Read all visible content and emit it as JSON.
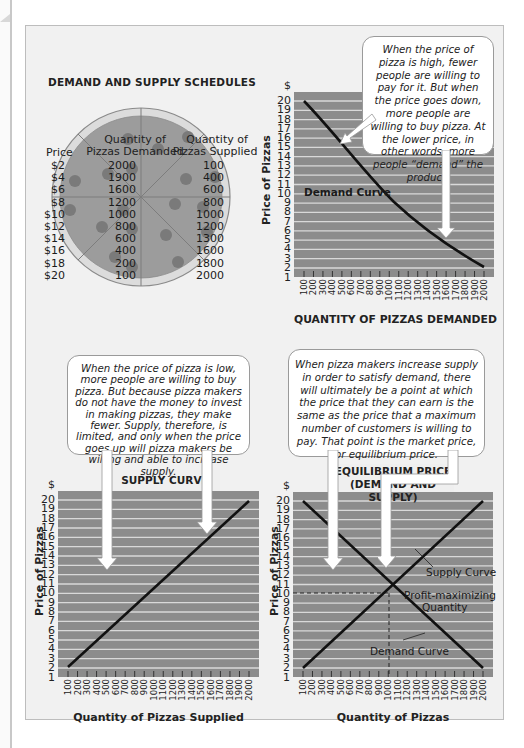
{
  "schedules": {
    "title": "DEMAND AND SUPPLY SCHEDULES",
    "headers": {
      "price": "Price",
      "demanded": [
        "Quantity of",
        "Pizzas Demanded"
      ],
      "supplied": [
        "Quantity of",
        "Pizzas Supplied"
      ]
    },
    "prices": [
      "$2",
      "$4",
      "$6",
      "$8",
      "$10",
      "$12",
      "$14",
      "$16",
      "$18",
      "$20"
    ],
    "demanded": [
      "2000",
      "1900",
      "1600",
      "1200",
      "1000",
      "800",
      "600",
      "400",
      "200",
      "100"
    ],
    "supplied": [
      "100",
      "400",
      "600",
      "800",
      "1000",
      "1200",
      "1300",
      "1600",
      "1800",
      "2000"
    ]
  },
  "demand_chart": {
    "callout": "When the price of pizza is high, fewer people are willing to pay for it. But when the price goes down, more people are willing to buy pizza. At the lower price, in other words, more people “demand” the product.",
    "curve_label": "Demand Curve",
    "ylabel": "Price of Pizzas",
    "xlabel": "QUANTITY OF PIZZAS DEMANDED"
  },
  "supply_chart": {
    "callout": "When the price of pizza is low, more people are willing to buy pizza. But because pizza makers do not have the money to invest in making pizzas, they make fewer. Supply, therefore, is limited, and only when the price goes up will pizza makers be willing and able to increase supply.",
    "header": "SUPPLY CURVE",
    "ylabel": "Price of Pizzas",
    "xlabel": "Quantity of Pizzas Supplied"
  },
  "equilibrium_chart": {
    "callout": "When pizza makers increase supply in order to satisfy demand, there will ultimately be a point at which the price that they can earn is the same as the price that a maximum number of customers is willing to pay. That point is the market price, or equilibrium price.",
    "header_line1": "EQUILIBRIUM PRICE",
    "header_line2": "(DEMAND AND SUPPLY)",
    "supply_label": "Supply Curve",
    "profit_label_1": "Profit-maximizing",
    "profit_label_2": "Quantity",
    "demand_label": "Demand Curve",
    "ylabel": "Price of Pizzas",
    "xlabel": "Quantity of Pizzas"
  },
  "axis": {
    "y_ticks": [
      "$",
      "20",
      "19",
      "18",
      "17",
      "16",
      "15",
      "14",
      "13",
      "12",
      "11",
      "10",
      "9",
      "8",
      "7",
      "6",
      "5",
      "4",
      "3",
      "2",
      "1"
    ],
    "x_ticks": [
      "100",
      "200",
      "300",
      "400",
      "500",
      "600",
      "700",
      "800",
      "900",
      "1000",
      "1100",
      "1200",
      "1300",
      "1400",
      "1500",
      "1600",
      "1700",
      "1800",
      "1900",
      "2000"
    ]
  },
  "colors": {
    "plot_bg": "#8c8c8c",
    "gridline": "#d9d9d9",
    "curve": "#111111",
    "pizza_crust": "#d6d6d6",
    "pizza_sauce": "#9a9a9a",
    "pepperoni": "#777777",
    "panel_bg": "#f1f1f1"
  },
  "chart_data": [
    {
      "type": "table",
      "title": "DEMAND AND SUPPLY SCHEDULES",
      "columns": [
        "Price",
        "Quantity of Pizzas Demanded",
        "Quantity of Pizzas Supplied"
      ],
      "rows": [
        [
          "$2",
          2000,
          100
        ],
        [
          "$4",
          1900,
          400
        ],
        [
          "$6",
          1600,
          600
        ],
        [
          "$8",
          1200,
          800
        ],
        [
          "$10",
          1000,
          1000
        ],
        [
          "$12",
          800,
          1200
        ],
        [
          "$14",
          600,
          1300
        ],
        [
          "$16",
          400,
          1600
        ],
        [
          "$18",
          200,
          1800
        ],
        [
          "$20",
          100,
          2000
        ]
      ]
    },
    {
      "type": "line",
      "title": "",
      "xlabel": "QUANTITY OF PIZZAS DEMANDED",
      "ylabel": "Price of Pizzas",
      "x": [
        100,
        500,
        1000,
        1500,
        2000
      ],
      "series": [
        {
          "name": "Demand Curve",
          "values": [
            20,
            15,
            10,
            6,
            2
          ]
        }
      ],
      "xlim": [
        100,
        2000
      ],
      "ylim": [
        1,
        20
      ],
      "grid": "horizontal"
    },
    {
      "type": "line",
      "title": "SUPPLY CURVE",
      "xlabel": "Quantity of Pizzas Supplied",
      "ylabel": "Price of Pizzas",
      "x": [
        100,
        2000
      ],
      "series": [
        {
          "name": "Supply Curve",
          "values": [
            2,
            20
          ]
        }
      ],
      "xlim": [
        100,
        2000
      ],
      "ylim": [
        1,
        20
      ],
      "grid": "horizontal"
    },
    {
      "type": "line",
      "title": "EQUILIBRIUM PRICE (DEMAND AND SUPPLY)",
      "xlabel": "Quantity of Pizzas",
      "ylabel": "Price of Pizzas",
      "x": [
        100,
        1000,
        2000
      ],
      "series": [
        {
          "name": "Demand Curve",
          "values": [
            20,
            10,
            2
          ]
        },
        {
          "name": "Supply Curve",
          "values": [
            2,
            10,
            20
          ]
        }
      ],
      "annotations": [
        {
          "label": "Profit-maximizing Quantity",
          "x": 1000,
          "y": 10
        }
      ],
      "xlim": [
        100,
        2000
      ],
      "ylim": [
        1,
        20
      ],
      "grid": "horizontal"
    }
  ]
}
